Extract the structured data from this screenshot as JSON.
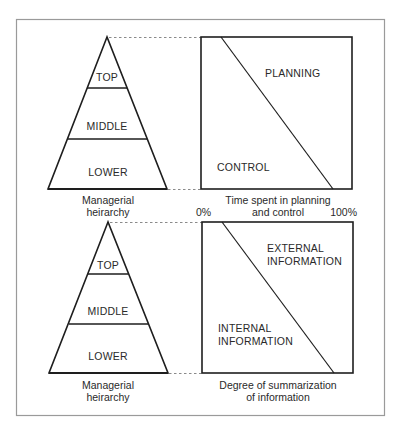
{
  "figure": {
    "top_panel": {
      "pyramid": {
        "levels": [
          "TOP",
          "MIDDLE",
          "LOWER"
        ],
        "caption_line1": "Managerial",
        "caption_line2": "heirarchy"
      },
      "box": {
        "upper_region_label": "PLANNING",
        "lower_region_label": "CONTROL",
        "caption_line1": "Time spent in planning",
        "caption_line2": "and control",
        "axis_min_label": "0%",
        "axis_max_label": "100%"
      }
    },
    "bottom_panel": {
      "pyramid": {
        "levels": [
          "TOP",
          "MIDDLE",
          "LOWER"
        ],
        "caption_line1": "Managerial",
        "caption_line2": "heirarchy"
      },
      "box": {
        "upper_region_label_line1": "EXTERNAL",
        "upper_region_label_line2": "INFORMATION",
        "lower_region_label_line1": "INTERNAL",
        "lower_region_label_line2": "INFORMATION",
        "caption_line1": "Degree of summarization",
        "caption_line2": "of information"
      }
    },
    "colors": {
      "ink": "#1e1e1e",
      "frame": "#9a9a9a",
      "dash": "#8a8a8a",
      "background": "#ffffff"
    }
  }
}
